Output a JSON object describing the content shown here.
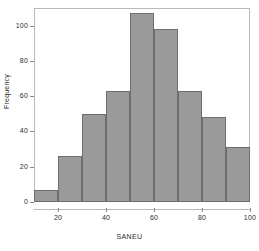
{
  "chart_data": {
    "type": "bar",
    "title": "",
    "subtitle": "",
    "xlabel": "SANEU",
    "ylabel": "Frequency",
    "categories": [
      "10-20",
      "20-30",
      "30-40",
      "40-50",
      "50-60",
      "60-70",
      "70-80",
      "80-90",
      "90-100"
    ],
    "bin_edges": [
      10,
      20,
      30,
      40,
      50,
      60,
      70,
      80,
      90,
      100
    ],
    "values": [
      7,
      26,
      50,
      63,
      107,
      98,
      63,
      48,
      31
    ],
    "xlim": [
      10,
      100
    ],
    "ylim": [
      0,
      110
    ],
    "x_ticks": [
      20,
      40,
      60,
      80,
      100
    ],
    "x_tick_labels": [
      "20",
      "40",
      "60",
      "80",
      "100"
    ],
    "y_ticks": [
      0,
      20,
      40,
      60,
      80,
      100
    ],
    "y_tick_labels": [
      "0",
      "20",
      "40",
      "60",
      "80",
      "100"
    ],
    "grid": false,
    "legend": null,
    "bar_fill_color": "#9a9a9a",
    "bar_edge_color": "#6e6e6e",
    "frame_color": "#b9b9b9",
    "background_color": "#ffffff",
    "text_color": "#2b2b2b"
  }
}
